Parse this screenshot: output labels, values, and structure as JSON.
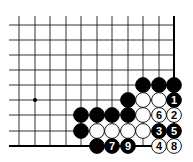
{
  "diagram": {
    "type": "go-board-fragment",
    "cols_x": [
      19,
      35,
      50,
      66,
      81,
      97,
      112,
      128,
      143,
      159,
      174
    ],
    "rows_y": [
      25,
      40,
      55,
      70,
      85,
      100,
      115,
      131,
      146
    ],
    "line_left_x": 9,
    "line_top_y": 16,
    "edges": [
      "right",
      "bottom"
    ],
    "star_points": [
      {
        "c": 1,
        "r": 5
      }
    ],
    "stones": [
      {
        "c": 8,
        "r": 4,
        "color": "black",
        "label": ""
      },
      {
        "c": 9,
        "r": 4,
        "color": "black",
        "label": ""
      },
      {
        "c": 10,
        "r": 4,
        "color": "black",
        "label": ""
      },
      {
        "c": 7,
        "r": 5,
        "color": "black",
        "label": ""
      },
      {
        "c": 8,
        "r": 5,
        "color": "white",
        "label": ""
      },
      {
        "c": 9,
        "r": 5,
        "color": "white",
        "label": ""
      },
      {
        "c": 10,
        "r": 5,
        "color": "black",
        "label": "1"
      },
      {
        "c": 4,
        "r": 6,
        "color": "black",
        "label": ""
      },
      {
        "c": 5,
        "r": 6,
        "color": "black",
        "label": ""
      },
      {
        "c": 6,
        "r": 6,
        "color": "black",
        "label": ""
      },
      {
        "c": 7,
        "r": 6,
        "color": "black",
        "label": ""
      },
      {
        "c": 8,
        "r": 6,
        "color": "white",
        "label": ""
      },
      {
        "c": 9,
        "r": 6,
        "color": "white",
        "label": "6"
      },
      {
        "c": 10,
        "r": 6,
        "color": "white",
        "label": "2"
      },
      {
        "c": 4,
        "r": 7,
        "color": "black",
        "label": ""
      },
      {
        "c": 5,
        "r": 7,
        "color": "white",
        "label": ""
      },
      {
        "c": 6,
        "r": 7,
        "color": "white",
        "label": ""
      },
      {
        "c": 7,
        "r": 7,
        "color": "white",
        "label": ""
      },
      {
        "c": 8,
        "r": 7,
        "color": "white",
        "label": ""
      },
      {
        "c": 9,
        "r": 7,
        "color": "black",
        "label": "3"
      },
      {
        "c": 10,
        "r": 7,
        "color": "black",
        "label": "5"
      },
      {
        "c": 5,
        "r": 8,
        "color": "black",
        "label": ""
      },
      {
        "c": 6,
        "r": 8,
        "color": "black",
        "label": "7"
      },
      {
        "c": 7,
        "r": 8,
        "color": "black",
        "label": "9"
      },
      {
        "c": 9,
        "r": 8,
        "color": "white",
        "label": "4"
      },
      {
        "c": 10,
        "r": 8,
        "color": "white",
        "label": "8"
      }
    ],
    "colors": {
      "line": "#000000",
      "black_stone": "#000000",
      "white_stone": "#ffffff",
      "background": "#ffffff"
    }
  }
}
